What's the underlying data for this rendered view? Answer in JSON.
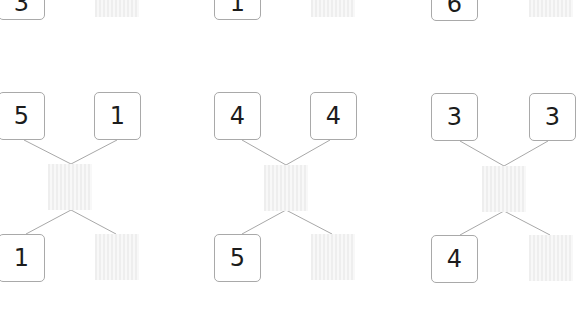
{
  "worksheet": {
    "partial_top_row": [
      {
        "left_number": "3",
        "answer_blank": ""
      },
      {
        "left_number": "1",
        "answer_blank": ""
      },
      {
        "left_number": "6",
        "answer_blank": ""
      }
    ],
    "problems": [
      {
        "top_left": "5",
        "top_right": "1",
        "middle_blank": "",
        "bottom_left": "1",
        "bottom_right_blank": ""
      },
      {
        "top_left": "4",
        "top_right": "4",
        "middle_blank": "",
        "bottom_left": "5",
        "bottom_right_blank": ""
      },
      {
        "top_left": "3",
        "top_right": "3",
        "middle_blank": "",
        "bottom_left": "4",
        "bottom_right_blank": ""
      }
    ],
    "colors": {
      "box_border": "#a9a9a9",
      "connector_line": "#a8a8a8",
      "blank_fill": "#eeeeee",
      "digit": "#1c1c1c"
    }
  }
}
